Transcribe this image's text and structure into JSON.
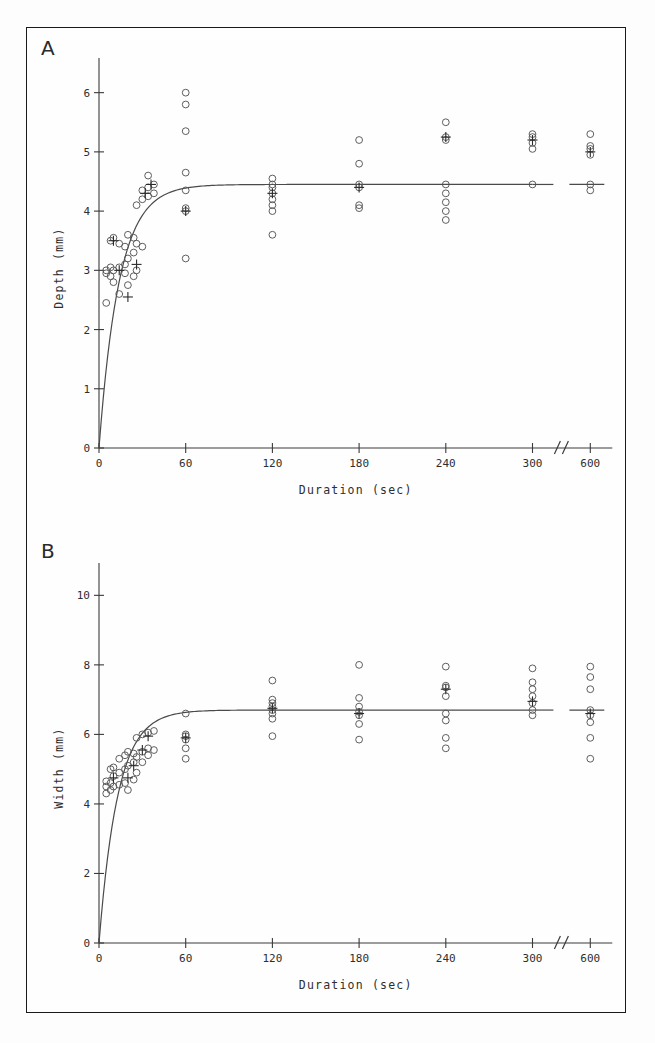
{
  "figure": {
    "panels": [
      {
        "letter": "A",
        "ylabel": "Depth (mm)",
        "xlabel": "Duration (sec)",
        "yticks": [
          "0",
          "1",
          "2",
          "3",
          "4",
          "5",
          "6"
        ],
        "xticks": [
          "0",
          "60",
          "120",
          "180",
          "240",
          "300",
          "600"
        ]
      },
      {
        "letter": "B",
        "ylabel": "Width (mm)",
        "xlabel": "Duration (sec)",
        "yticks": [
          "0",
          "2",
          "4",
          "6",
          "8",
          "10"
        ],
        "xticks": [
          "0",
          "60",
          "120",
          "180",
          "240",
          "300",
          "600"
        ]
      }
    ]
  },
  "chart_data": [
    {
      "type": "scatter",
      "panel": "A",
      "title": "",
      "xlabel": "Duration (sec)",
      "ylabel": "Depth (mm)",
      "xlim": [
        0,
        340
      ],
      "ylim": [
        0,
        6.4
      ],
      "xticks": [
        0,
        60,
        120,
        180,
        240,
        300,
        600
      ],
      "yticks": [
        0,
        1,
        2,
        3,
        4,
        5,
        6
      ],
      "axis_break": {
        "after": 300,
        "before": 600,
        "style": "double-slash"
      },
      "grid": false,
      "legend": null,
      "fit": {
        "model": "saturating-exponential",
        "asymptote": 4.45,
        "rate_tau_sec": 14,
        "description": "Depth rises steeply from 0 and plateaus near 4.45 mm by about 60 sec"
      },
      "points": [
        {
          "x": 5,
          "y": 2.45
        },
        {
          "x": 5,
          "y": 2.95
        },
        {
          "x": 5,
          "y": 3.0
        },
        {
          "x": 8,
          "y": 2.9
        },
        {
          "x": 8,
          "y": 3.05
        },
        {
          "x": 8,
          "y": 3.5
        },
        {
          "x": 10,
          "y": 2.8
        },
        {
          "x": 10,
          "y": 3.0
        },
        {
          "x": 10,
          "y": 3.55
        },
        {
          "x": 14,
          "y": 2.6
        },
        {
          "x": 14,
          "y": 3.05
        },
        {
          "x": 14,
          "y": 3.45
        },
        {
          "x": 18,
          "y": 2.95
        },
        {
          "x": 18,
          "y": 3.1
        },
        {
          "x": 18,
          "y": 3.4
        },
        {
          "x": 20,
          "y": 2.75
        },
        {
          "x": 20,
          "y": 3.2
        },
        {
          "x": 20,
          "y": 3.6
        },
        {
          "x": 24,
          "y": 2.9
        },
        {
          "x": 24,
          "y": 3.3
        },
        {
          "x": 24,
          "y": 3.55
        },
        {
          "x": 26,
          "y": 3.0
        },
        {
          "x": 26,
          "y": 3.45
        },
        {
          "x": 26,
          "y": 4.1
        },
        {
          "x": 30,
          "y": 3.4
        },
        {
          "x": 30,
          "y": 4.2
        },
        {
          "x": 30,
          "y": 4.35
        },
        {
          "x": 34,
          "y": 4.25
        },
        {
          "x": 34,
          "y": 4.4
        },
        {
          "x": 34,
          "y": 4.6
        },
        {
          "x": 38,
          "y": 4.3
        },
        {
          "x": 38,
          "y": 4.45
        },
        {
          "x": 60,
          "y": 3.2
        },
        {
          "x": 60,
          "y": 4.0
        },
        {
          "x": 60,
          "y": 4.05
        },
        {
          "x": 60,
          "y": 4.35
        },
        {
          "x": 60,
          "y": 4.65
        },
        {
          "x": 60,
          "y": 5.35
        },
        {
          "x": 60,
          "y": 5.8
        },
        {
          "x": 60,
          "y": 6.0
        },
        {
          "x": 120,
          "y": 3.6
        },
        {
          "x": 120,
          "y": 4.0
        },
        {
          "x": 120,
          "y": 4.1
        },
        {
          "x": 120,
          "y": 4.2
        },
        {
          "x": 120,
          "y": 4.3
        },
        {
          "x": 120,
          "y": 4.4
        },
        {
          "x": 120,
          "y": 4.45
        },
        {
          "x": 120,
          "y": 4.55
        },
        {
          "x": 180,
          "y": 4.05
        },
        {
          "x": 180,
          "y": 4.1
        },
        {
          "x": 180,
          "y": 4.4
        },
        {
          "x": 180,
          "y": 4.45
        },
        {
          "x": 180,
          "y": 4.8
        },
        {
          "x": 180,
          "y": 5.2
        },
        {
          "x": 240,
          "y": 3.85
        },
        {
          "x": 240,
          "y": 4.0
        },
        {
          "x": 240,
          "y": 4.15
        },
        {
          "x": 240,
          "y": 4.3
        },
        {
          "x": 240,
          "y": 4.45
        },
        {
          "x": 240,
          "y": 5.2
        },
        {
          "x": 240,
          "y": 5.25
        },
        {
          "x": 240,
          "y": 5.5
        },
        {
          "x": 300,
          "y": 4.45
        },
        {
          "x": 300,
          "y": 5.05
        },
        {
          "x": 300,
          "y": 5.15
        },
        {
          "x": 300,
          "y": 5.25
        },
        {
          "x": 300,
          "y": 5.3
        },
        {
          "x": 600,
          "y": 4.35
        },
        {
          "x": 600,
          "y": 4.45
        },
        {
          "x": 600,
          "y": 4.95
        },
        {
          "x": 600,
          "y": 5.05
        },
        {
          "x": 600,
          "y": 5.1
        },
        {
          "x": 600,
          "y": 5.3
        }
      ],
      "mean_markers": [
        {
          "x": 10,
          "y": 3.5
        },
        {
          "x": 14,
          "y": 3.0
        },
        {
          "x": 20,
          "y": 2.55
        },
        {
          "x": 26,
          "y": 3.1
        },
        {
          "x": 32,
          "y": 4.3
        },
        {
          "x": 36,
          "y": 4.45
        },
        {
          "x": 60,
          "y": 4.0
        },
        {
          "x": 120,
          "y": 4.3
        },
        {
          "x": 180,
          "y": 4.4
        },
        {
          "x": 240,
          "y": 5.25
        },
        {
          "x": 300,
          "y": 5.2
        },
        {
          "x": 600,
          "y": 5.0
        }
      ]
    },
    {
      "type": "scatter",
      "panel": "B",
      "title": "",
      "xlabel": "Duration (sec)",
      "ylabel": "Width (mm)",
      "xlim": [
        0,
        340
      ],
      "ylim": [
        0,
        10.6
      ],
      "xticks": [
        0,
        60,
        120,
        180,
        240,
        300,
        600
      ],
      "yticks": [
        0,
        2,
        4,
        6,
        8,
        10
      ],
      "axis_break": {
        "after": 300,
        "before": 600,
        "style": "double-slash"
      },
      "grid": false,
      "legend": null,
      "fit": {
        "model": "saturating-exponential",
        "asymptote": 6.7,
        "rate_tau_sec": 13,
        "description": "Width rises steeply from 0 and plateaus near 6.7 mm by about 60 sec"
      },
      "points": [
        {
          "x": 5,
          "y": 4.3
        },
        {
          "x": 5,
          "y": 4.5
        },
        {
          "x": 5,
          "y": 4.65
        },
        {
          "x": 8,
          "y": 4.4
        },
        {
          "x": 8,
          "y": 4.6
        },
        {
          "x": 8,
          "y": 5.0
        },
        {
          "x": 10,
          "y": 4.5
        },
        {
          "x": 10,
          "y": 4.8
        },
        {
          "x": 10,
          "y": 5.05
        },
        {
          "x": 14,
          "y": 4.55
        },
        {
          "x": 14,
          "y": 4.9
        },
        {
          "x": 14,
          "y": 5.3
        },
        {
          "x": 18,
          "y": 4.6
        },
        {
          "x": 18,
          "y": 5.0
        },
        {
          "x": 18,
          "y": 5.4
        },
        {
          "x": 20,
          "y": 4.4
        },
        {
          "x": 20,
          "y": 5.1
        },
        {
          "x": 20,
          "y": 5.5
        },
        {
          "x": 24,
          "y": 4.7
        },
        {
          "x": 24,
          "y": 5.2
        },
        {
          "x": 24,
          "y": 5.45
        },
        {
          "x": 26,
          "y": 4.9
        },
        {
          "x": 26,
          "y": 5.35
        },
        {
          "x": 26,
          "y": 5.9
        },
        {
          "x": 30,
          "y": 5.2
        },
        {
          "x": 30,
          "y": 5.5
        },
        {
          "x": 30,
          "y": 6.0
        },
        {
          "x": 34,
          "y": 5.4
        },
        {
          "x": 34,
          "y": 5.6
        },
        {
          "x": 34,
          "y": 6.05
        },
        {
          "x": 38,
          "y": 5.55
        },
        {
          "x": 38,
          "y": 6.1
        },
        {
          "x": 60,
          "y": 5.3
        },
        {
          "x": 60,
          "y": 5.6
        },
        {
          "x": 60,
          "y": 5.85
        },
        {
          "x": 60,
          "y": 5.95
        },
        {
          "x": 60,
          "y": 6.0
        },
        {
          "x": 60,
          "y": 6.6
        },
        {
          "x": 120,
          "y": 5.95
        },
        {
          "x": 120,
          "y": 6.45
        },
        {
          "x": 120,
          "y": 6.6
        },
        {
          "x": 120,
          "y": 6.7
        },
        {
          "x": 120,
          "y": 6.8
        },
        {
          "x": 120,
          "y": 6.9
        },
        {
          "x": 120,
          "y": 7.0
        },
        {
          "x": 120,
          "y": 7.55
        },
        {
          "x": 180,
          "y": 5.85
        },
        {
          "x": 180,
          "y": 6.3
        },
        {
          "x": 180,
          "y": 6.55
        },
        {
          "x": 180,
          "y": 6.65
        },
        {
          "x": 180,
          "y": 6.8
        },
        {
          "x": 180,
          "y": 7.05
        },
        {
          "x": 180,
          "y": 8.0
        },
        {
          "x": 240,
          "y": 5.6
        },
        {
          "x": 240,
          "y": 5.9
        },
        {
          "x": 240,
          "y": 6.4
        },
        {
          "x": 240,
          "y": 6.6
        },
        {
          "x": 240,
          "y": 7.1
        },
        {
          "x": 240,
          "y": 7.35
        },
        {
          "x": 240,
          "y": 7.4
        },
        {
          "x": 240,
          "y": 7.95
        },
        {
          "x": 300,
          "y": 6.55
        },
        {
          "x": 300,
          "y": 6.7
        },
        {
          "x": 300,
          "y": 6.9
        },
        {
          "x": 300,
          "y": 7.1
        },
        {
          "x": 300,
          "y": 7.3
        },
        {
          "x": 300,
          "y": 7.5
        },
        {
          "x": 300,
          "y": 7.9
        },
        {
          "x": 600,
          "y": 5.3
        },
        {
          "x": 600,
          "y": 5.9
        },
        {
          "x": 600,
          "y": 6.35
        },
        {
          "x": 600,
          "y": 6.55
        },
        {
          "x": 600,
          "y": 6.7
        },
        {
          "x": 600,
          "y": 7.3
        },
        {
          "x": 600,
          "y": 7.65
        },
        {
          "x": 600,
          "y": 7.95
        }
      ],
      "mean_markers": [
        {
          "x": 10,
          "y": 4.75
        },
        {
          "x": 20,
          "y": 4.75
        },
        {
          "x": 24,
          "y": 5.1
        },
        {
          "x": 30,
          "y": 5.55
        },
        {
          "x": 34,
          "y": 5.95
        },
        {
          "x": 60,
          "y": 5.9
        },
        {
          "x": 120,
          "y": 6.75
        },
        {
          "x": 180,
          "y": 6.6
        },
        {
          "x": 240,
          "y": 7.3
        },
        {
          "x": 300,
          "y": 6.95
        },
        {
          "x": 600,
          "y": 6.6
        }
      ]
    }
  ]
}
